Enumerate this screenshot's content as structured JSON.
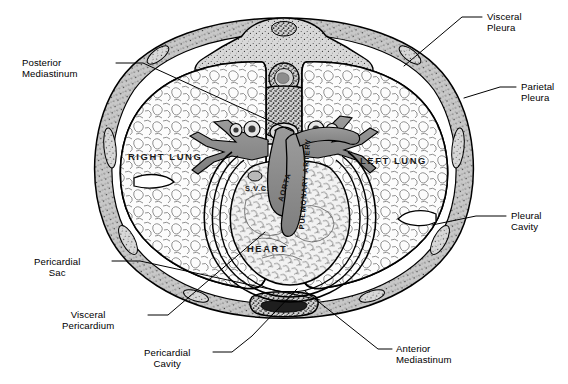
{
  "figure": {
    "background_color": "#ffffff",
    "ink_color": "#000000",
    "vessel_fill": "#8e8e8e",
    "wall_fill": "#c9c9c9",
    "lung_fill": "#fbfbfb"
  },
  "callouts": [
    {
      "id": "posterior-mediastinum",
      "lines": [
        "Posterior",
        "Mediastinum"
      ],
      "align": "left",
      "text_x": 22,
      "text_y": 57,
      "leader": [
        [
          116,
          63
        ],
        [
          143,
          63
        ],
        [
          292,
          131
        ]
      ]
    },
    {
      "id": "visceral-pleura",
      "lines": [
        "Visceral",
        "Pleura"
      ],
      "align": "left",
      "text_x": 487,
      "text_y": 11,
      "leader": [
        [
          482,
          17
        ],
        [
          462,
          17
        ],
        [
          404,
          66
        ]
      ]
    },
    {
      "id": "parietal-pleura",
      "lines": [
        "Parietal",
        "Pleura"
      ],
      "align": "left",
      "text_x": 521,
      "text_y": 81,
      "leader": [
        [
          516,
          87
        ],
        [
          500,
          87
        ],
        [
          464,
          98
        ]
      ]
    },
    {
      "id": "pleural-cavity",
      "lines": [
        "Pleural",
        "Cavity"
      ],
      "align": "left",
      "text_x": 511,
      "text_y": 210,
      "leader": [
        [
          506,
          216
        ],
        [
          476,
          216
        ],
        [
          432,
          225
        ]
      ]
    },
    {
      "id": "anterior-mediastinum",
      "lines": [
        "Anterior",
        "Mediastinum"
      ],
      "align": "left",
      "text_x": 396,
      "text_y": 343,
      "leader": [
        [
          392,
          349
        ],
        [
          378,
          349
        ],
        [
          305,
          291
        ]
      ]
    },
    {
      "id": "pericardial-cavity",
      "lines": [
        "Pericardial",
        "Cavity"
      ],
      "align": "center",
      "text_x": 144,
      "text_y": 347,
      "leader": [
        [
          213,
          352
        ],
        [
          232,
          352
        ],
        [
          252,
          336
        ],
        [
          297,
          289
        ]
      ]
    },
    {
      "id": "visceral-pericardium",
      "lines": [
        "Visceral",
        "Pericardium"
      ],
      "align": "center",
      "text_x": 62,
      "text_y": 309,
      "leader": [
        [
          148,
          315
        ],
        [
          168,
          315
        ],
        [
          265,
          232
        ]
      ]
    },
    {
      "id": "pericardial-sac",
      "lines": [
        "Pericardial",
        "Sac"
      ],
      "align": "center",
      "text_x": 34,
      "text_y": 256,
      "leader": [
        [
          112,
          261
        ],
        [
          140,
          261
        ],
        [
          320,
          300
        ]
      ]
    }
  ],
  "figure_labels": [
    {
      "id": "right-lung",
      "text": "RIGHT LUNG",
      "x": 128,
      "y": 151
    },
    {
      "id": "left-lung",
      "text": "LEFT LUNG",
      "x": 360,
      "y": 155
    },
    {
      "id": "heart",
      "text": "HEART",
      "x": 247,
      "y": 243
    },
    {
      "id": "svc",
      "text": "S.V.C.",
      "x": 245,
      "y": 184
    }
  ],
  "vessel_labels": [
    {
      "id": "aorta",
      "text": "AORTA",
      "x": 276,
      "y": 200,
      "rotate": -74
    },
    {
      "id": "pulmonary-artery",
      "text": "PULMONARY ARTERY",
      "x": 297,
      "y": 229,
      "rotate": -86
    }
  ],
  "structures": [
    {
      "id": "vertebra",
      "name": "thoracic vertebra"
    },
    {
      "id": "sternum",
      "name": "sternum"
    },
    {
      "id": "rib",
      "name": "rib"
    },
    {
      "id": "chest-wall",
      "name": "thoracic wall"
    },
    {
      "id": "esophagus",
      "name": "esophagus"
    },
    {
      "id": "bronchus",
      "name": "bronchus"
    },
    {
      "id": "spinal-cord",
      "name": "spinal cord"
    }
  ]
}
